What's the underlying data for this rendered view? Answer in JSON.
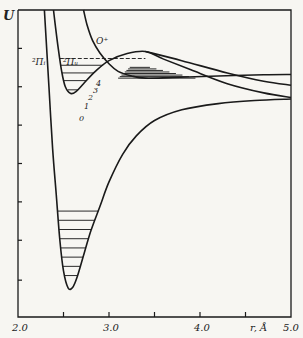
{
  "chart_data": {
    "type": "line",
    "title": "",
    "xlabel": "r, Å",
    "ylabel": "U",
    "xlim": [
      2.0,
      5.0
    ],
    "ylim": [
      0,
      100
    ],
    "grid": false,
    "x_ticks": [
      2.0,
      2.5,
      3.0,
      3.5,
      4.0,
      4.5,
      5.0
    ],
    "x_tick_labels": [
      {
        "x": 2.0,
        "label": "2.0"
      },
      {
        "x": 3.0,
        "label": "3.0"
      },
      {
        "x": 4.0,
        "label": "4.0"
      },
      {
        "x": 5.0,
        "label": "5.0"
      }
    ],
    "y_ticks": [
      12,
      25,
      37.5,
      50,
      62.5,
      75,
      87.5
    ],
    "series": [
      {
        "name": "²Πᵢ",
        "label": "²Πᵢ",
        "points": [
          [
            2.29,
            100
          ],
          [
            2.31,
            90
          ],
          [
            2.34,
            75
          ],
          [
            2.38,
            55
          ],
          [
            2.42,
            40
          ],
          [
            2.46,
            25
          ],
          [
            2.5,
            15
          ],
          [
            2.55,
            9.5
          ],
          [
            2.6,
            9.6
          ],
          [
            2.65,
            13
          ],
          [
            2.72,
            20
          ],
          [
            2.8,
            28
          ],
          [
            2.9,
            36
          ],
          [
            3.0,
            44
          ],
          [
            3.15,
            53
          ],
          [
            3.3,
            59
          ],
          [
            3.5,
            64
          ],
          [
            3.8,
            67.5
          ],
          [
            4.2,
            69.5
          ],
          [
            4.6,
            70.5
          ],
          [
            5.0,
            71
          ]
        ],
        "levels": [
          34.5,
          31.5,
          28.5,
          25.5,
          22.5,
          19.5,
          16.5,
          13.5
        ]
      },
      {
        "name": "²Πᵤ",
        "label": "²Πᵤ",
        "points": [
          [
            2.39,
            100
          ],
          [
            2.41,
            95
          ],
          [
            2.44,
            88
          ],
          [
            2.48,
            80
          ],
          [
            2.52,
            75
          ],
          [
            2.58,
            72.8
          ],
          [
            2.64,
            73.5
          ],
          [
            2.72,
            76
          ],
          [
            2.85,
            80
          ],
          [
            3.0,
            83.5
          ],
          [
            3.2,
            85.8
          ],
          [
            3.4,
            86.5
          ],
          [
            3.6,
            84
          ],
          [
            3.9,
            80.5
          ],
          [
            4.3,
            76
          ],
          [
            4.7,
            73
          ],
          [
            5.0,
            71.5
          ]
        ],
        "levels": [
          {
            "v": 0,
            "value": 74.0
          },
          {
            "v": 1,
            "value": 77.0
          },
          {
            "v": 2,
            "value": 79.5
          },
          {
            "v": 3,
            "value": 82.0
          },
          {
            "v": 4,
            "value": 84.2,
            "dashed": true
          }
        ]
      },
      {
        "name": "O⁺",
        "label": "O⁺",
        "points": [
          [
            2.72,
            100
          ],
          [
            2.76,
            95
          ],
          [
            2.82,
            90
          ],
          [
            2.9,
            86
          ],
          [
            3.0,
            82.5
          ],
          [
            3.1,
            80
          ],
          [
            3.25,
            78.5
          ],
          [
            3.4,
            77.8
          ],
          [
            3.7,
            78
          ],
          [
            4.2,
            78.5
          ],
          [
            4.7,
            78.9
          ],
          [
            5.0,
            79
          ]
        ],
        "hatched_band": {
          "x_range": [
            3.08,
            3.95
          ],
          "y_range": [
            84.2,
            77.8
          ]
        }
      },
      {
        "name": "crossing",
        "label": "",
        "points": [
          [
            3.4,
            86.5
          ],
          [
            3.8,
            83.5
          ],
          [
            4.3,
            79.5
          ],
          [
            4.7,
            76.8
          ],
          [
            5.0,
            75.5
          ]
        ]
      }
    ],
    "annotations": [
      "²Πᵢ",
      "²Πᵤ",
      "O⁺",
      "0",
      "1",
      "2",
      "3",
      "4"
    ]
  }
}
